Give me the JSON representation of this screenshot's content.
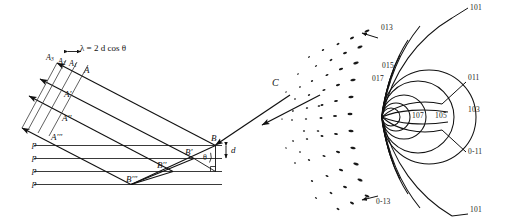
{
  "figure": {
    "background_color": "#ffffff",
    "ink_color": "#111111",
    "panels": [
      "bragg-reflection-diagram",
      "diffraction-arc-pattern"
    ]
  },
  "left_panel": {
    "name": "bragg-reflection-diagram",
    "equation": "λ = 2 d cos θ",
    "equation_parts": {
      "lambda": "λ",
      "equals": "=",
      "factor": "2",
      "spacing_symbol": "d",
      "function": "cos",
      "angle_symbol": "θ"
    },
    "outgoing_ray_labels": [
      "A",
      "A'",
      "A''",
      "A'''"
    ],
    "wavefront_labels": [
      "A₁",
      "A₂",
      "A₃"
    ],
    "wavefront_label_text": [
      "A1",
      "A2",
      "A3"
    ],
    "reflection_point_labels": [
      "B",
      "B'",
      "B''",
      "B'''"
    ],
    "plane_labels": [
      "p",
      "p",
      "p",
      "p"
    ],
    "plane_count": 4,
    "spacing_label": "d",
    "angle_label": "θ",
    "incident_beam_label": "C",
    "has_right_angle_marker": true
  },
  "right_panel": {
    "name": "diffraction-arc-pattern",
    "incident_beam_label": "C",
    "arc_index_labels": [
      {
        "text": "101",
        "position": "top-right-outer"
      },
      {
        "text": "013",
        "position": "top-left"
      },
      {
        "text": "015",
        "position": "upper-left"
      },
      {
        "text": "017",
        "position": "upper-left-inner"
      },
      {
        "text": "011",
        "position": "right-upper"
      },
      {
        "text": "103",
        "position": "right"
      },
      {
        "text": "105",
        "position": "center-right"
      },
      {
        "text": "107",
        "position": "center"
      },
      {
        "text": "0-11",
        "position": "right-lower"
      },
      {
        "text": "0-13",
        "position": "bottom-left"
      },
      {
        "text": "101",
        "position": "bottom-right"
      }
    ],
    "speckle_description": "elongated diffraction spots arranged along arcs",
    "speckle_count": 58
  }
}
